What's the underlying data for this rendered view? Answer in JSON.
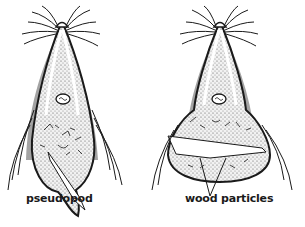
{
  "figure": {
    "cells": [
      {
        "id": "left",
        "label": "pseudopod"
      },
      {
        "id": "right",
        "label": "wood particles"
      }
    ],
    "colors": {
      "ink": "#1a1a1a",
      "background": "#ffffff",
      "stipple": "#8a8a8a"
    }
  },
  "labels": {
    "pseudopod": "pseudopod",
    "wood_particles": "wood particles"
  }
}
